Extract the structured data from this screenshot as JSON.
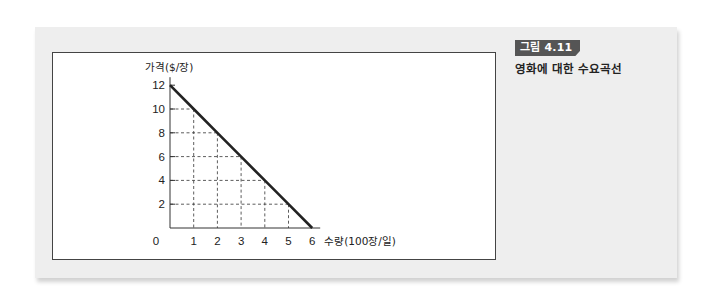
{
  "figure": {
    "badge_label": "그림 4.11",
    "caption": "영화에 대한 수요곡선",
    "colors": {
      "panel_bg": "#eeeeee",
      "badge_bg": "#555555",
      "badge_text": "#ffffff",
      "line": "#222222",
      "grid": "#333333"
    }
  },
  "chart_data": {
    "type": "line",
    "title": "영화에 대한 수요곡선",
    "xlabel": "수량(100장/일)",
    "ylabel": "가격($/장)",
    "x_ticks": [
      "0",
      "1",
      "2",
      "3",
      "4",
      "5",
      "6"
    ],
    "y_ticks": [
      "2",
      "4",
      "6",
      "8",
      "10",
      "12"
    ],
    "xlim": [
      0,
      6
    ],
    "ylim": [
      0,
      12
    ],
    "grid": "dashed drop-lines from curve points to axes",
    "legend": "none",
    "series": [
      {
        "name": "수요곡선",
        "x": [
          0,
          1,
          2,
          3,
          4,
          5,
          6
        ],
        "y": [
          12,
          10,
          8,
          6,
          4,
          2,
          0
        ]
      }
    ]
  }
}
